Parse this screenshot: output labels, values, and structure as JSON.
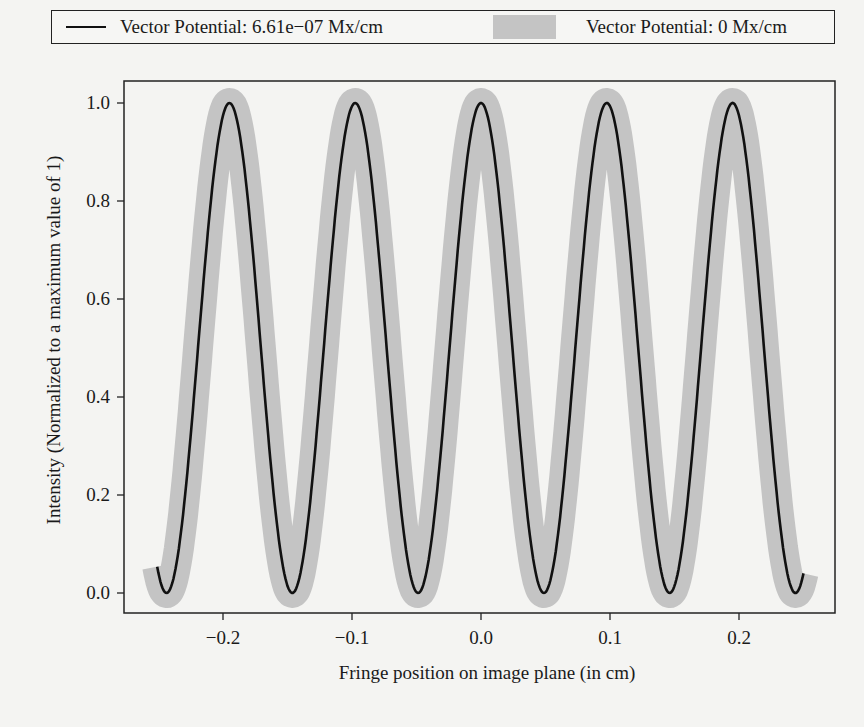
{
  "chart_data": {
    "type": "line",
    "title": "",
    "xlabel": "Fringe position on image plane (in cm)",
    "ylabel": "Intensity (Normalized to a maximum value of 1)",
    "xlim": [
      -0.275,
      0.275
    ],
    "ylim": [
      -0.04,
      1.05
    ],
    "xticks": [
      -0.2,
      -0.1,
      0.0,
      0.1,
      0.2
    ],
    "xtick_labels": [
      "−0.2",
      "−0.1",
      "0.0",
      "0.1",
      "0.2"
    ],
    "yticks": [
      0.0,
      0.2,
      0.4,
      0.6,
      0.8,
      1.0
    ],
    "ytick_labels": [
      "0.0",
      "0.2",
      "0.4",
      "0.6",
      "0.8",
      "1.0"
    ],
    "grid": false,
    "legend_position": "top, outside plot",
    "series": [
      {
        "name": "Vector Potential: 6.61e−07 Mx/cm",
        "style": "thin black line",
        "color": "#111111",
        "function": "cos^2(pi*x/0.0975)",
        "x_range": [
          -0.251,
          0.25
        ],
        "peaks_x": [
          -0.195,
          -0.098,
          0.0,
          0.094,
          0.192
        ],
        "minima_x": [
          -0.244,
          -0.146,
          -0.049,
          0.049,
          0.146,
          0.242
        ],
        "peak_value": 1.0,
        "min_value": 0.0
      },
      {
        "name": "Vector Potential: 0 Mx/cm",
        "style": "thick gray band",
        "color": "#c4c4c4",
        "function": "cos^2(pi*x/0.0975)",
        "x_range": [
          -0.263,
          0.263
        ],
        "peaks_x": [
          -0.195,
          -0.098,
          0.0,
          0.094,
          0.192
        ],
        "peak_value": 1.0,
        "min_value": 0.0
      }
    ]
  },
  "legend": {
    "items": [
      {
        "label": "Vector Potential: 6.61e−07 Mx/cm"
      },
      {
        "label": "Vector Potential: 0 Mx/cm"
      }
    ]
  },
  "colors": {
    "background": "#f4f4f2",
    "axis": "#222222",
    "line": "#111111",
    "band": "#c4c4c4"
  }
}
